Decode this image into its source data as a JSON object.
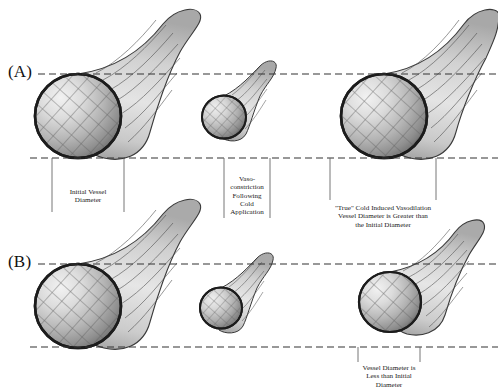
{
  "figure": {
    "background_color": "#ffffff",
    "line_color": "#333333",
    "vessel_outline_color": "#1c1c1c"
  },
  "panels": [
    {
      "label": "(A)",
      "name": "panel-a",
      "guide_top_y": 74,
      "guide_bottom_y": 158,
      "vessels": [
        {
          "name": "initial-vessel",
          "state": "initial"
        },
        {
          "name": "vasoconstricted-vessel",
          "state": "constricted"
        },
        {
          "name": "vasodilated-vessel",
          "state": "dilated-greater"
        }
      ]
    },
    {
      "label": "(B)",
      "name": "panel-b",
      "guide_top_y": 264,
      "guide_bottom_y": 347,
      "vessels": [
        {
          "name": "initial-vessel",
          "state": "initial"
        },
        {
          "name": "vasoconstricted-vessel",
          "state": "constricted"
        },
        {
          "name": "partially-dilated-vessel",
          "state": "dilated-less"
        }
      ]
    }
  ],
  "captions": {
    "initial_diameter": "Initial Vessel\nDiameter",
    "vasoconstriction": "Vaso-\nconstriction\nFollowing\nCold\nApplication",
    "true_civd": "\"True\" Cold Induced Vasodilation\nVessel Diameter is Greater than\nthe Initial Diameter",
    "less_than_initial": "Vessel Diameter is\nLess than Initial\nDiameter"
  }
}
